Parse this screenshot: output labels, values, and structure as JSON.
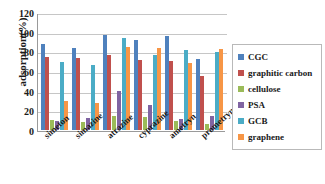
{
  "chart_data": {
    "type": "bar",
    "title": "",
    "xlabel": "",
    "ylabel": "adsorption(%)",
    "ylim": [
      0,
      120
    ],
    "yticks": [
      0,
      20,
      40,
      60,
      80,
      100,
      120
    ],
    "grid": true,
    "legend_position": "right",
    "categories": [
      "simeton",
      "simazine",
      "atrazine",
      "cyprazine",
      "ametryn",
      "prometryn"
    ],
    "series": [
      {
        "name": "CGC",
        "color": "#4F६81BD",
        "values": [
          88,
          84,
          97,
          92,
          96,
          73
        ]
      },
      {
        "name": "graphitic carbon",
        "color": "#C0504D",
        "values": [
          75,
          74,
          77,
          72,
          71,
          55
        ]
      },
      {
        "name": "cellulose",
        "color": "#9BBB59",
        "values": [
          10,
          8,
          14,
          13,
          9,
          6
        ]
      },
      {
        "name": "PSA",
        "color": "#8064A2",
        "values": [
          9,
          12,
          40,
          26,
          11,
          14
        ]
      },
      {
        "name": "GCB",
        "color": "#4BACC6",
        "values": [
          70,
          67,
          94,
          77,
          82,
          80
        ]
      },
      {
        "name": "graphene",
        "color": "#F79646",
        "values": [
          30,
          28,
          85,
          84,
          69,
          83
        ]
      }
    ]
  },
  "legend": {
    "items": [
      {
        "label": "CGC",
        "color": "#4F81BD"
      },
      {
        "label": "graphitic carbon",
        "color": "#C0504D"
      },
      {
        "label": "cellulose",
        "color": "#9BBB59"
      },
      {
        "label": "PSA",
        "color": "#8064A2"
      },
      {
        "label": "GCB",
        "color": "#4BACC6"
      },
      {
        "label": "graphene",
        "color": "#F79646"
      }
    ]
  },
  "axis": {
    "y_title": "adsorption(%)",
    "y_tick_labels": [
      "120",
      "100",
      "80",
      "60",
      "40",
      "20",
      "0"
    ],
    "x_tick_labels": [
      "simeton",
      "simazine",
      "atrazine",
      "cyprazine",
      "ametryn",
      "prometryn"
    ]
  }
}
